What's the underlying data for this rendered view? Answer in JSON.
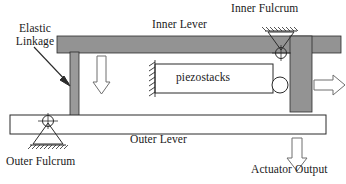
{
  "figure": {
    "type": "mechanical-schematic",
    "canvas": {
      "width": 346,
      "height": 184
    },
    "background_color": "#ffffff"
  },
  "labels": {
    "elastic_linkage": "Elastic\nLinkage",
    "elastic_linkage_line1": "Elastic",
    "elastic_linkage_line2": "Linkage",
    "inner_lever": "Inner Lever",
    "inner_fulcrum": "Inner Fulcrum",
    "piezostacks": "piezostacks",
    "outer_lever": "Outer Lever",
    "outer_fulcrum": "Outer Fulcrum",
    "actuator_output": "Actuator Output"
  },
  "colors": {
    "gray_fill": "#939393",
    "gray_fill_light": "#9a9a9a",
    "stroke": "#2b2b2b",
    "text": "#1a1a1a",
    "white_fill": "#ffffff",
    "arrow_stroke": "#6e6e6e"
  },
  "components": [
    {
      "name": "inner-lever-beam",
      "shape": "filled-rectangle",
      "fill": "#939393",
      "x": 57,
      "y": 36,
      "width": 284,
      "height": 17
    },
    {
      "name": "right-vertical-column",
      "shape": "filled-rectangle",
      "fill": "#939393",
      "x": 290,
      "y": 36,
      "width": 22,
      "height": 76
    },
    {
      "name": "elastic-linkage-bar",
      "shape": "filled-rectangle",
      "fill": "#9a9a9a",
      "x": 70,
      "y": 53,
      "width": 9,
      "height": 64
    },
    {
      "name": "outer-lever-beam",
      "shape": "outlined-rectangle",
      "fill": "#ffffff",
      "x": 10,
      "y": 115,
      "width": 316,
      "height": 19
    },
    {
      "name": "piezostacks-box",
      "shape": "outlined-rectangle",
      "fill": "#ffffff",
      "x": 155,
      "y": 64,
      "width": 118,
      "height": 29
    },
    {
      "name": "piezostack-roller-circle",
      "shape": "circle",
      "cx": 278,
      "cy": 85,
      "r": 8
    },
    {
      "name": "inner-fulcrum-pivot",
      "shape": "triangle-pivot-up",
      "apex_x": 281,
      "apex_y": 52,
      "ground_y": 31,
      "half_width": 14
    },
    {
      "name": "outer-fulcrum-pivot",
      "shape": "triangle-pivot-down",
      "apex_x": 48,
      "apex_y": 122,
      "ground_y": 145,
      "half_width": 16
    },
    {
      "name": "piezostack-fixed-support",
      "shape": "hatched-wall-left",
      "x": 155,
      "y": 62,
      "height": 33
    },
    {
      "name": "inner-lever-force-arrow",
      "shape": "hollow-arrow-down",
      "x": 101,
      "y": 55,
      "length": 37,
      "shaft_width": 9,
      "head_width": 17
    },
    {
      "name": "actuator-output-arrow",
      "shape": "hollow-arrow-down",
      "x": 297,
      "y": 137,
      "length": 29,
      "shaft_width": 10,
      "head_width": 18
    },
    {
      "name": "right-output-arrow",
      "shape": "hollow-arrow-right",
      "x": 318,
      "y": 84,
      "length": 26,
      "shaft_width": 10,
      "head_width": 18
    },
    {
      "name": "elastic-linkage-leader-arrow",
      "shape": "leader-arrow",
      "from_x": 36,
      "from_y": 48,
      "to_x": 71,
      "to_y": 84
    }
  ]
}
